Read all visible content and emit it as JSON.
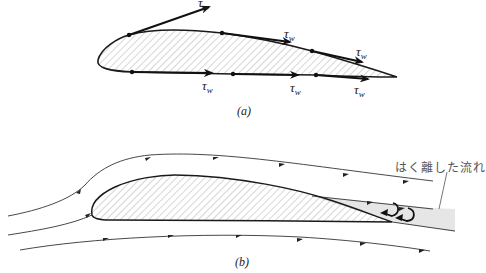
{
  "figure": {
    "panel_a": {
      "caption": "(a)",
      "shear_labels": [
        {
          "symbol": "τ",
          "subscript": "w",
          "x": 198,
          "y": -3
        },
        {
          "symbol": "τ",
          "subscript": "w",
          "x": 284,
          "y": 28
        },
        {
          "symbol": "τ",
          "subscript": "w",
          "x": 355,
          "y": 46
        },
        {
          "symbol": "τ",
          "subscript": "w",
          "x": 202,
          "y": 81
        },
        {
          "symbol": "τ",
          "subscript": "w",
          "x": 289,
          "y": 83
        },
        {
          "symbol": "τ",
          "subscript": "w",
          "x": 354,
          "y": 85
        }
      ],
      "description": "Airfoil with wall shear stress vectors along upper and lower surfaces"
    },
    "panel_b": {
      "caption": "(b)",
      "annotation": "はく離した流れ",
      "description": "Streamlines around airfoil showing separated flow region at trailing edge"
    },
    "colors": {
      "outline": "#1a1a1a",
      "hatch": "#888888",
      "separated_region": "#e6e6e6",
      "text": "#222222",
      "annotation_text": "#555555"
    }
  }
}
